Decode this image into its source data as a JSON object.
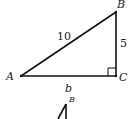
{
  "diagram": {
    "type": "right-triangle",
    "vertices": {
      "A": "A",
      "B": "B",
      "C": "C"
    },
    "right_angle_at": "C",
    "sides": {
      "hypotenuse_AB": "10",
      "side_BC": "5",
      "side_AC": "b"
    },
    "second_figure": {
      "vertex_label": "B"
    }
  }
}
